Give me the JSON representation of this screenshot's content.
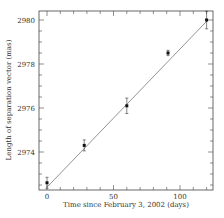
{
  "chart_data": {
    "type": "scatter",
    "title": "",
    "xlabel": "Time since February 3, 2002 (days)",
    "ylabel": "Length of separation vector (mas)",
    "xlim": [
      -8,
      125
    ],
    "ylim": [
      2971.6,
      2980.4
    ],
    "xticks": [
      0,
      50,
      100
    ],
    "yticks": [
      2974,
      2976,
      2978,
      2980
    ],
    "grid": false,
    "legend": null,
    "series": [
      {
        "name": "measurements",
        "x": [
          0,
          28,
          60,
          91,
          120
        ],
        "y": [
          2972.6,
          2974.3,
          2976.1,
          2978.5,
          2980.0
        ],
        "yerr": [
          0.25,
          0.25,
          0.35,
          0.12,
          0.4
        ]
      },
      {
        "name": "linear fit",
        "type": "line",
        "x": [
          0,
          121
        ],
        "y": [
          2972.4,
          2980.0
        ]
      }
    ]
  }
}
